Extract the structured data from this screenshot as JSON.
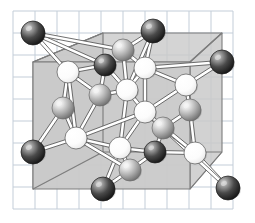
{
  "figure": {
    "kind": "ball-and-stick-unit-cell",
    "canvas": {
      "width": 255,
      "height": 223,
      "background": "#ffffff"
    }
  },
  "grid": {
    "name": "graph-paper-grid",
    "line_color": "#c3cdd8",
    "spacing": 22,
    "x_start": 13,
    "y_start": 11,
    "x_end": 233,
    "y_end": 209,
    "line_width": 1
  },
  "cell_box": {
    "name": "unit-cell-box",
    "fill": "#c9c9c9",
    "fill_opacity": 0.92,
    "edge_color": "#7d7d7d",
    "edge_width": 1.1,
    "front_face": [
      [
        33,
        62
      ],
      [
        190,
        62
      ],
      [
        190,
        189
      ],
      [
        33,
        189
      ]
    ],
    "back_face": [
      [
        33,
        33
      ],
      [
        222,
        33
      ],
      [
        222,
        152
      ],
      [
        33,
        152
      ]
    ],
    "vertices": {
      "front_top_left": [
        33,
        62
      ],
      "front_top_right": [
        190,
        62
      ],
      "front_bottom_left": [
        33,
        189
      ],
      "front_bottom_right": [
        190,
        189
      ],
      "back_top_left": [
        103,
        33
      ],
      "back_top_right": [
        222,
        33
      ],
      "back_bottom_left": [
        103,
        152
      ],
      "back_bottom_right": [
        222,
        152
      ]
    },
    "polygon_top": [
      [
        33,
        62
      ],
      [
        103,
        33
      ],
      [
        222,
        33
      ],
      [
        190,
        62
      ]
    ],
    "polygon_right": [
      [
        190,
        62
      ],
      [
        222,
        33
      ],
      [
        222,
        152
      ],
      [
        190,
        189
      ]
    ],
    "polygon_left": [
      [
        33,
        62
      ],
      [
        103,
        33
      ],
      [
        103,
        152
      ],
      [
        33,
        189
      ]
    ],
    "polygon_front": [
      [
        33,
        62
      ],
      [
        190,
        62
      ],
      [
        190,
        189
      ],
      [
        33,
        189
      ]
    ]
  },
  "atom_types": [
    {
      "key": "dark",
      "label": "dark atom",
      "fill": "#3a3a3a",
      "highlight": "#d8d8d8",
      "rim": "#1a1a1a"
    },
    {
      "key": "gray",
      "label": "gray atom",
      "fill": "#a8a8a8",
      "highlight": "#f2f2f2",
      "rim": "#6a6a6a"
    },
    {
      "key": "white",
      "label": "white atom",
      "fill": "#fbfbfb",
      "highlight": "#ffffff",
      "rim": "#555555"
    }
  ],
  "atoms": [
    {
      "id": 0,
      "type": "dark",
      "cx": 33,
      "cy": 33,
      "r": 12
    },
    {
      "id": 1,
      "type": "dark",
      "cx": 153,
      "cy": 31,
      "r": 12
    },
    {
      "id": 2,
      "type": "dark",
      "cx": 222,
      "cy": 62,
      "r": 12
    },
    {
      "id": 3,
      "type": "dark",
      "cx": 33,
      "cy": 152,
      "r": 12
    },
    {
      "id": 4,
      "type": "dark",
      "cx": 103,
      "cy": 189,
      "r": 12
    },
    {
      "id": 5,
      "type": "dark",
      "cx": 228,
      "cy": 188,
      "r": 12
    },
    {
      "id": 6,
      "type": "dark",
      "cx": 105,
      "cy": 65,
      "r": 11
    },
    {
      "id": 7,
      "type": "dark",
      "cx": 155,
      "cy": 152,
      "r": 11
    },
    {
      "id": 8,
      "type": "gray",
      "cx": 123,
      "cy": 50,
      "r": 11
    },
    {
      "id": 9,
      "type": "gray",
      "cx": 100,
      "cy": 95,
      "r": 11
    },
    {
      "id": 10,
      "type": "gray",
      "cx": 63,
      "cy": 108,
      "r": 11
    },
    {
      "id": 11,
      "type": "gray",
      "cx": 190,
      "cy": 110,
      "r": 11
    },
    {
      "id": 12,
      "type": "gray",
      "cx": 163,
      "cy": 128,
      "r": 11
    },
    {
      "id": 13,
      "type": "gray",
      "cx": 130,
      "cy": 170,
      "r": 11
    },
    {
      "id": 14,
      "type": "white",
      "cx": 68,
      "cy": 72,
      "r": 11
    },
    {
      "id": 15,
      "type": "white",
      "cx": 145,
      "cy": 68,
      "r": 11
    },
    {
      "id": 16,
      "type": "white",
      "cx": 127,
      "cy": 90,
      "r": 11
    },
    {
      "id": 17,
      "type": "white",
      "cx": 186,
      "cy": 85,
      "r": 11
    },
    {
      "id": 18,
      "type": "white",
      "cx": 145,
      "cy": 112,
      "r": 11
    },
    {
      "id": 19,
      "type": "white",
      "cx": 76,
      "cy": 138,
      "r": 11
    },
    {
      "id": 20,
      "type": "white",
      "cx": 120,
      "cy": 148,
      "r": 11
    },
    {
      "id": 21,
      "type": "white",
      "cx": 195,
      "cy": 153,
      "r": 11
    }
  ],
  "bonds": {
    "name": "bond-rods",
    "fill": "#ffffff",
    "edge": "#4a4a4a",
    "width": 3.4,
    "pairs": [
      [
        0,
        14
      ],
      [
        0,
        6
      ],
      [
        0,
        8
      ],
      [
        1,
        15
      ],
      [
        1,
        8
      ],
      [
        1,
        16
      ],
      [
        2,
        17
      ],
      [
        2,
        15
      ],
      [
        3,
        19
      ],
      [
        3,
        10
      ],
      [
        4,
        13
      ],
      [
        4,
        20
      ],
      [
        5,
        21
      ],
      [
        5,
        12
      ],
      [
        6,
        14
      ],
      [
        6,
        16
      ],
      [
        6,
        9
      ],
      [
        7,
        20
      ],
      [
        7,
        12
      ],
      [
        7,
        13
      ],
      [
        7,
        21
      ],
      [
        8,
        15
      ],
      [
        8,
        16
      ],
      [
        9,
        14
      ],
      [
        9,
        16
      ],
      [
        9,
        19
      ],
      [
        10,
        14
      ],
      [
        10,
        19
      ],
      [
        11,
        17
      ],
      [
        11,
        21
      ],
      [
        11,
        12
      ],
      [
        12,
        18
      ],
      [
        12,
        21
      ],
      [
        13,
        20
      ],
      [
        13,
        19
      ],
      [
        14,
        19
      ],
      [
        15,
        16
      ],
      [
        15,
        17
      ],
      [
        15,
        18
      ],
      [
        16,
        18
      ],
      [
        16,
        20
      ],
      [
        17,
        18
      ],
      [
        18,
        20
      ],
      [
        18,
        21
      ],
      [
        18,
        19
      ],
      [
        19,
        20
      ]
    ]
  }
}
